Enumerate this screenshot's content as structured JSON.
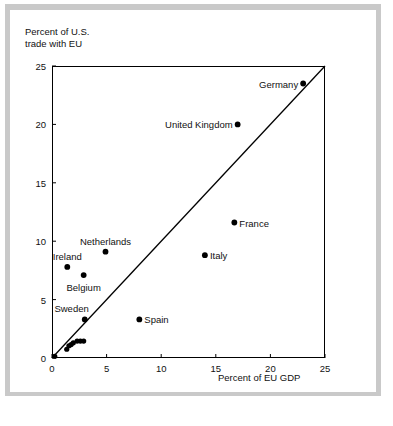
{
  "chart_data": {
    "type": "scatter",
    "title": "",
    "xlabel": "Percent of EU GDP",
    "ylabel": "Percent of U.S.\ntrade with EU",
    "xlim": [
      0,
      25
    ],
    "ylim": [
      0,
      25
    ],
    "xticks": [
      0,
      5,
      10,
      15,
      20,
      25
    ],
    "yticks": [
      0,
      5,
      10,
      15,
      20,
      25
    ],
    "xtick_labels": [
      "0",
      "5",
      "10",
      "15",
      "20",
      "25"
    ],
    "ytick_labels": [
      "0",
      "5",
      "10",
      "15",
      "20",
      "25"
    ],
    "grid": false,
    "legend": "none",
    "reference_line": {
      "name": "45-degree line",
      "from": [
        0,
        0
      ],
      "to": [
        25,
        25
      ]
    },
    "points": [
      {
        "label": "Germany",
        "x": 23.0,
        "y": 23.5,
        "label_pos": "left"
      },
      {
        "label": "United Kingdom",
        "x": 17.0,
        "y": 20.0,
        "label_pos": "left"
      },
      {
        "label": "France",
        "x": 16.7,
        "y": 11.6,
        "label_pos": "right"
      },
      {
        "label": "Italy",
        "x": 14.0,
        "y": 8.8,
        "label_pos": "right"
      },
      {
        "label": "Netherlands",
        "x": 4.9,
        "y": 9.1,
        "label_pos": "above"
      },
      {
        "label": "Ireland",
        "x": 1.4,
        "y": 7.8,
        "label_pos": "above"
      },
      {
        "label": "Belgium",
        "x": 2.9,
        "y": 7.1,
        "label_pos": "below"
      },
      {
        "label": "Sweden",
        "x": 3.0,
        "y": 3.3,
        "label_pos": "above-left"
      },
      {
        "label": "Spain",
        "x": 8.0,
        "y": 3.3,
        "label_pos": "right"
      }
    ],
    "unlabeled_points": [
      {
        "x": 0.25,
        "y": 0.15
      },
      {
        "x": 1.35,
        "y": 0.75
      },
      {
        "x": 1.55,
        "y": 1.05
      },
      {
        "x": 1.75,
        "y": 1.15
      },
      {
        "x": 1.95,
        "y": 1.3
      },
      {
        "x": 2.3,
        "y": 1.45
      },
      {
        "x": 2.6,
        "y": 1.45
      },
      {
        "x": 2.9,
        "y": 1.45
      }
    ]
  },
  "colors": {
    "marker": "#000000",
    "line": "#000000",
    "axis": "#000000",
    "text": "#111111",
    "panel": "#ffffff",
    "mat": "#c9c9c9"
  }
}
